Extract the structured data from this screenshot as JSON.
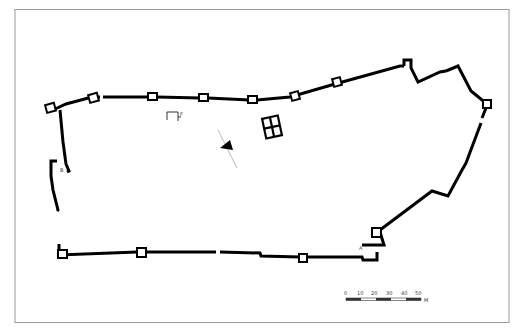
{
  "drawing": {
    "type": "architectural site plan (fortification walls)",
    "labels": {
      "a": "A",
      "b": "B",
      "f": "F"
    },
    "north_arrow": "north-arrow",
    "scale_bar": {
      "ticks": [
        "0",
        "10",
        "20",
        "30",
        "40",
        "50"
      ],
      "unit": "M"
    },
    "colors": {
      "wall": "#000000",
      "frame": "#9a9a9a",
      "background": "#ffffff"
    }
  }
}
